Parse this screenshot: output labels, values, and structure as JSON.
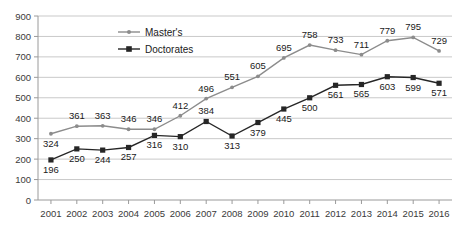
{
  "chart_data": {
    "type": "line",
    "title": "",
    "xlabel": "",
    "ylabel": "",
    "ylim": [
      0,
      900
    ],
    "ytick_step": 100,
    "grid": true,
    "legend_position": "top-center",
    "categories": [
      "2001",
      "2002",
      "2003",
      "2004",
      "2005",
      "2006",
      "2007",
      "2008",
      "2009",
      "2010",
      "2011",
      "2012",
      "2013",
      "2014",
      "2015",
      "2016"
    ],
    "series": [
      {
        "name": "Master's",
        "color": "#8c8c8c",
        "marker": "diamond",
        "values": [
          324,
          361,
          363,
          346,
          346,
          412,
          496,
          551,
          605,
          695,
          758,
          733,
          711,
          779,
          795,
          729
        ]
      },
      {
        "name": "Doctorates",
        "color": "#262626",
        "marker": "square",
        "values": [
          196,
          250,
          244,
          257,
          316,
          310,
          384,
          313,
          379,
          445,
          500,
          561,
          565,
          603,
          599,
          571
        ]
      }
    ],
    "yticks": [
      "0",
      "100",
      "200",
      "300",
      "400",
      "500",
      "600",
      "700",
      "800",
      "900"
    ]
  },
  "legend": {
    "items": [
      {
        "label": "Master's"
      },
      {
        "label": "Doctorates"
      }
    ]
  },
  "colors": {
    "masters": "#8c8c8c",
    "doctorates": "#262626",
    "grid": "#c9c9c9",
    "axis": "#9a9a9a",
    "text": "#3a3a3a",
    "background": "#ffffff"
  }
}
